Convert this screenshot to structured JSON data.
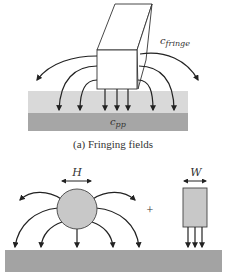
{
  "figure": {
    "panel_a": {
      "caption": "(a) Fringing fields",
      "fringe_label": "c",
      "fringe_sub": "fringe",
      "pp_label": "c",
      "pp_sub": "pp"
    },
    "panel_b": {
      "h_label": "H",
      "w_label": "W",
      "plus": "+"
    },
    "colors": {
      "line": "#222222",
      "dielectric_light": "#d9d9d9",
      "substrate_dark": "#a6a6a6",
      "wire_fill": "#c8c8c8",
      "ground": "#a3a3a3"
    }
  }
}
